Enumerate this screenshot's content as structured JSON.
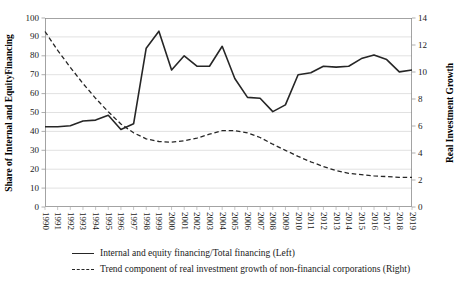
{
  "chart_data": {
    "type": "line",
    "title": "",
    "x": [
      1990,
      1991,
      1992,
      1993,
      1994,
      1995,
      1996,
      1997,
      1998,
      1999,
      2000,
      2001,
      2002,
      2003,
      2004,
      2005,
      2006,
      2007,
      2008,
      2009,
      2010,
      2011,
      2012,
      2013,
      2014,
      2015,
      2016,
      2017,
      2018,
      2019
    ],
    "series": [
      {
        "name": "Internal and equity financing/Total financing (Left)",
        "axis": "left",
        "line_style": "solid",
        "color": "#262626",
        "values": [
          42.5,
          42.5,
          43,
          45.5,
          46,
          48.5,
          41,
          44,
          84,
          93,
          72.5,
          80,
          74.5,
          74.5,
          85,
          68,
          58,
          57.5,
          50.5,
          54,
          70,
          71,
          74.5,
          74,
          74.5,
          78.5,
          80.5,
          78,
          71.5,
          72.5
        ]
      },
      {
        "name": "Trend component of real investment growth of non-financial corporations (Right)",
        "axis": "right",
        "line_style": "dashed",
        "color": "#262626",
        "values": [
          13,
          11.6,
          10.35,
          9.15,
          8.05,
          7.05,
          6.15,
          5.5,
          5.05,
          4.85,
          4.8,
          4.9,
          5.1,
          5.4,
          5.65,
          5.65,
          5.5,
          5.15,
          4.65,
          4.2,
          3.75,
          3.35,
          3,
          2.7,
          2.5,
          2.4,
          2.3,
          2.25,
          2.2,
          2.2
        ]
      }
    ],
    "left_axis": {
      "label": "Share of Internal and EquityFinancing",
      "min": 0,
      "max": 100,
      "step": 10
    },
    "right_axis": {
      "label": "Real Investment Growth",
      "min": 0,
      "max": 14,
      "step": 2
    },
    "x_axis": {
      "tick_rotation_deg": 90
    },
    "grid": "horizontal",
    "legend_position": "bottom",
    "colors": {
      "line": "#262626",
      "grid": "#d9d9d9",
      "border": "#8c8c8c",
      "tick": "#8c8c8c",
      "text": "#1a1a1a"
    }
  }
}
